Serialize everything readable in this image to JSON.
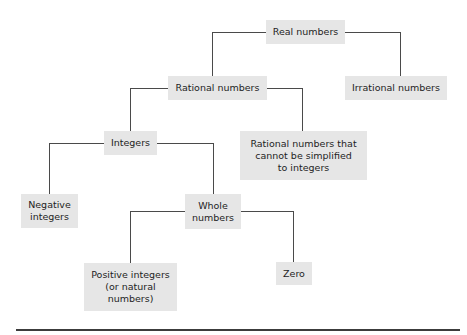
{
  "diagram": {
    "type": "hierarchy-tree",
    "nodes": {
      "real": {
        "label": "Real numbers"
      },
      "rational": {
        "label": "Rational numbers"
      },
      "irrational": {
        "label": "Irrational numbers"
      },
      "integers": {
        "label": "Integers"
      },
      "rational_non_integer": {
        "label": "Rational numbers that\ncannot be simplified\nto integers"
      },
      "negative": {
        "label": "Negative\nintegers"
      },
      "whole": {
        "label": "Whole\nnumbers"
      },
      "positive": {
        "label": "Positive integers\n(or natural\nnumbers)"
      },
      "zero": {
        "label": "Zero"
      }
    },
    "edges": [
      [
        "Real numbers",
        "Rational numbers"
      ],
      [
        "Real numbers",
        "Irrational numbers"
      ],
      [
        "Rational numbers",
        "Integers"
      ],
      [
        "Rational numbers",
        "Rational numbers that cannot be simplified to integers"
      ],
      [
        "Integers",
        "Negative integers"
      ],
      [
        "Integers",
        "Whole numbers"
      ],
      [
        "Whole numbers",
        "Positive integers (or natural numbers)"
      ],
      [
        "Whole numbers",
        "Zero"
      ]
    ],
    "colors": {
      "node_fill": "#e6e6e6",
      "connector": "#4a4a4a",
      "text": "#1e1e1e"
    }
  }
}
